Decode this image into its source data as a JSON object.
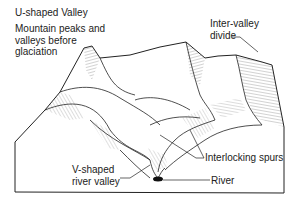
{
  "figure": {
    "title": "U-shaped Valley",
    "subtitle_line1": "Mountain peaks and",
    "subtitle_line2": "valleys before",
    "subtitle_line3": "glaciation"
  },
  "labels": {
    "inter_valley_line1": "Inter-valley",
    "inter_valley_line2": "divide",
    "interlocking_spurs": "Interlocking spurs",
    "v_shaped_line1": "V-shaped",
    "v_shaped_line2": "river valley",
    "river": "River"
  },
  "colors": {
    "ink": "#222222",
    "hatch": "#555555",
    "river": "#111111",
    "background": "#ffffff"
  }
}
